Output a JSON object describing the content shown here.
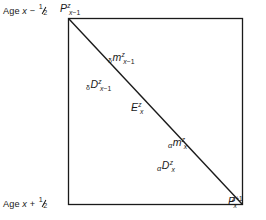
{
  "figure": {
    "type": "lexis-diagram",
    "background_color": "#ffffff",
    "line_color": "#1a1a1a",
    "box": {
      "left": 68,
      "top": 18,
      "right": 243,
      "bottom": 205
    },
    "diagonal": {
      "from": "top-left",
      "to": "bottom-right"
    },
    "captions": {
      "top": {
        "prefix": "Age",
        "variable": "x",
        "operator": "−",
        "fraction_num": "1",
        "fraction_den": "2"
      },
      "bottom": {
        "prefix": "Age",
        "variable": "x",
        "operator": "+",
        "fraction_num": "1",
        "fraction_den": "2"
      }
    },
    "labels": [
      {
        "name": "p-top-left",
        "prefix": "",
        "base": "P",
        "superscript": "z",
        "subscript": "x",
        "subscript_suffix": "−1",
        "text": "P^z_{x-1}"
      },
      {
        "name": "m-upper",
        "prefix": "δ",
        "base": "m",
        "superscript": "z",
        "subscript": "x",
        "subscript_suffix": "−1",
        "text": "δ m^z_{x-1}"
      },
      {
        "name": "d-upper",
        "prefix": "δ",
        "base": "D",
        "superscript": "z",
        "subscript": "x",
        "subscript_suffix": "−1",
        "text": "δ D^z_{x-1}"
      },
      {
        "name": "e-center",
        "prefix": "",
        "base": "E",
        "superscript": "z",
        "subscript": "x",
        "subscript_suffix": "",
        "text": "E^z_x"
      },
      {
        "name": "m-lower",
        "prefix": "α",
        "base": "m",
        "superscript": "z",
        "subscript": "x",
        "subscript_suffix": "",
        "text": "α m^z_x"
      },
      {
        "name": "d-lower",
        "prefix": "α",
        "base": "D",
        "superscript": "z",
        "subscript": "x",
        "subscript_suffix": "",
        "text": "α D^z_x"
      },
      {
        "name": "p-bottom-right",
        "prefix": "",
        "base": "P",
        "superscript": "z",
        "superscript_suffix": "+1",
        "subscript": "x",
        "subscript_suffix": "",
        "text": "P^{z+1}_x"
      }
    ]
  }
}
